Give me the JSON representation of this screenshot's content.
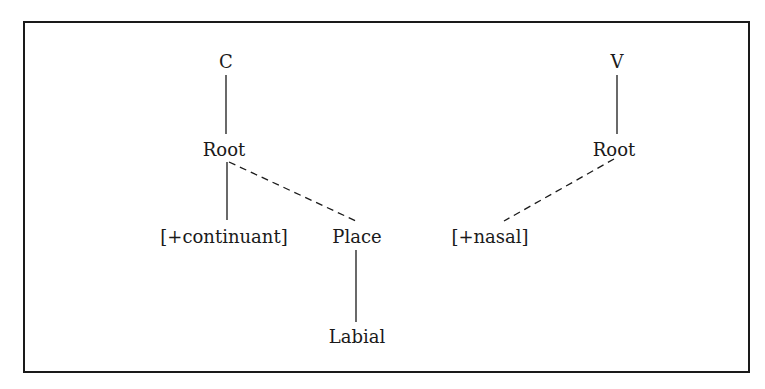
{
  "diagram": {
    "type": "feature-geometry-tree",
    "left_tree": {
      "nodes": {
        "c": "C",
        "root": "Root",
        "continuant": "[+continuant]",
        "place": "Place",
        "labial": "Labial"
      },
      "edges": [
        {
          "from": "C",
          "to": "Root",
          "style": "solid"
        },
        {
          "from": "Root",
          "to": "[+continuant]",
          "style": "solid"
        },
        {
          "from": "Root",
          "to": "Place",
          "style": "dashed"
        },
        {
          "from": "Place",
          "to": "Labial",
          "style": "solid"
        }
      ]
    },
    "right_tree": {
      "nodes": {
        "v": "V",
        "root": "Root",
        "nasal": "[+nasal]"
      },
      "edges": [
        {
          "from": "V",
          "to": "Root",
          "style": "solid"
        },
        {
          "from": "Root",
          "to": "[+nasal]",
          "style": "dashed"
        }
      ]
    }
  }
}
